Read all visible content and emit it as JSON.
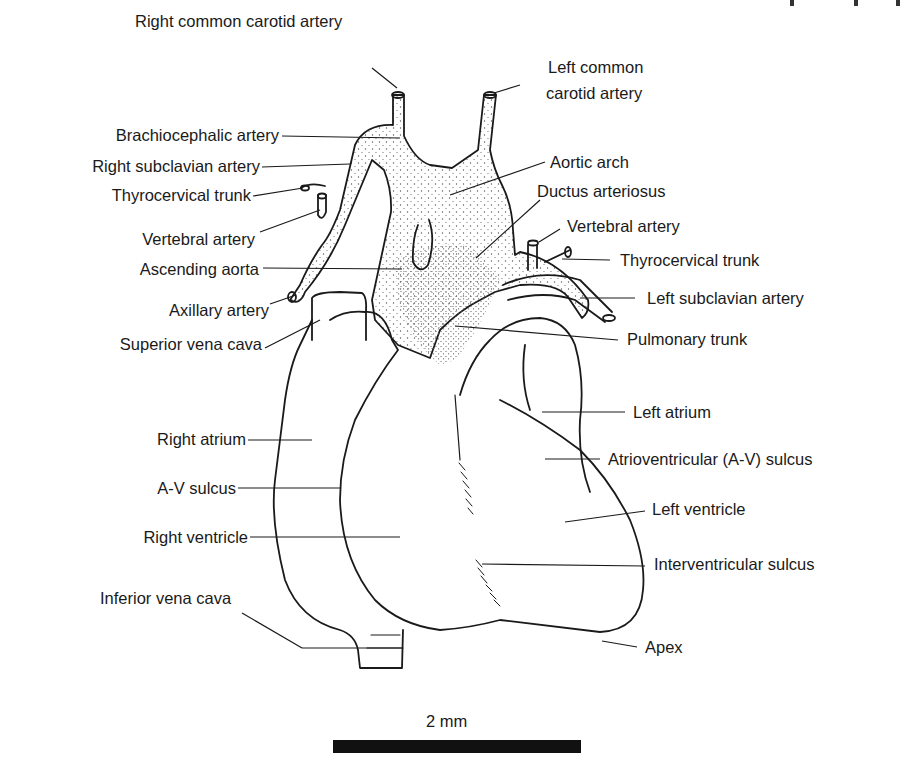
{
  "diagram": {
    "type": "anatomical-illustration",
    "labels": {
      "right_common_carotid": "Right common carotid artery",
      "left_common_carotid_1": "Left common",
      "left_common_carotid_2": "carotid artery",
      "brachiocephalic": "Brachiocephalic artery",
      "right_subclavian": "Right subclavian artery",
      "thyrocervical_right": "Thyrocervical trunk",
      "vertebral_right": "Vertebral artery",
      "ascending_aorta": "Ascending aorta",
      "axillary": "Axillary artery",
      "superior_vena_cava": "Superior vena cava",
      "aortic_arch": "Aortic arch",
      "ductus_arteriosus": "Ductus arteriosus",
      "vertebral_left": "Vertebral artery",
      "thyrocervical_left": "Thyrocervical trunk",
      "left_subclavian": "Left subclavian artery",
      "pulmonary_trunk": "Pulmonary trunk",
      "right_atrium": "Right atrium",
      "av_sulcus_right": "A-V sulcus",
      "right_ventricle": "Right ventricle",
      "inferior_vena_cava": "Inferior vena cava",
      "left_atrium": "Left atrium",
      "av_sulcus_left": "Atrioventricular (A-V) sulcus",
      "left_ventricle": "Left ventricle",
      "interventricular_sulcus": "Interventricular sulcus",
      "apex": "Apex"
    },
    "scale_bar": {
      "label": "2 mm"
    },
    "colors": {
      "ink": "#1a1a1a",
      "background": "#ffffff",
      "stipple": "#555555"
    }
  }
}
